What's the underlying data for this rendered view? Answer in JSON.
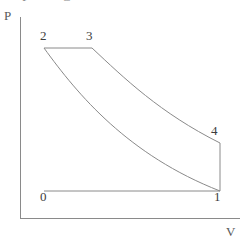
{
  "figure": {
    "title": "",
    "background_color": "#ffffff",
    "line_color": "#8a8a8a",
    "axis_color": "#8a8a8a",
    "text_color": "#3d3d3d"
  },
  "axes": {
    "y_label": "P",
    "x_label": "V",
    "y_axis": {
      "x": 20,
      "y_top": 17,
      "y_bottom": 218
    },
    "x_axis": {
      "y": 218,
      "x_left": 20,
      "x_right": 240
    }
  },
  "clipped_top_text": {
    "glyph_1": "P",
    "glyph_2": "C"
  },
  "point_labels": [
    {
      "name": "0",
      "text": "0",
      "x": 44,
      "y": 196
    },
    {
      "name": "1",
      "text": "1",
      "x": 218,
      "y": 196
    },
    {
      "name": "2",
      "text": "2",
      "x": 44,
      "y": 35
    },
    {
      "name": "3",
      "text": "3",
      "x": 90,
      "y": 35
    },
    {
      "name": "4",
      "text": "4",
      "x": 215,
      "y": 130
    }
  ],
  "chart_data": {
    "type": "line",
    "title": "",
    "xlabel": "V",
    "ylabel": "P",
    "grid": false,
    "legend": null,
    "axis_ranges": {
      "x": [
        20,
        240
      ],
      "y": [
        17,
        218
      ]
    },
    "states": [
      {
        "label": "0",
        "x": 44,
        "y": 191
      },
      {
        "label": "1",
        "x": 220,
        "y": 191
      },
      {
        "label": "2",
        "x": 44,
        "y": 48
      },
      {
        "label": "3",
        "x": 92,
        "y": 48
      },
      {
        "label": "4",
        "x": 220,
        "y": 143
      }
    ],
    "series": [
      {
        "name": "2-3 constant pressure",
        "kind": "straight",
        "path": "M 44 48 L 92 48"
      },
      {
        "name": "3-4 expansion",
        "kind": "curve",
        "path": "M 92 48 C 124 78, 160 113, 220 143"
      },
      {
        "name": "4-1 constant volume",
        "kind": "straight",
        "path": "M 220 143 L 220 191"
      },
      {
        "name": "1-0 constant pressure",
        "kind": "straight",
        "path": "M 220 191 L 44 191"
      },
      {
        "name": "2-1 compression",
        "kind": "curve",
        "path": "M 44 48 C 78 95, 128 155, 220 191"
      }
    ]
  }
}
